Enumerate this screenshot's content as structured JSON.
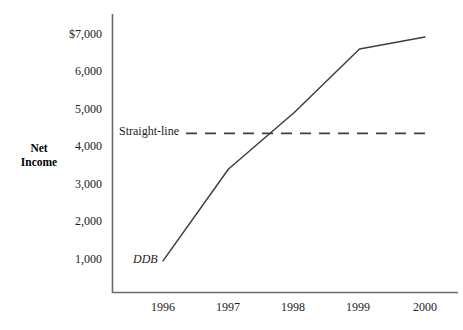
{
  "chart_data": {
    "type": "line",
    "title": "",
    "xlabel": "",
    "ylabel": "Net Income",
    "ylabel_lines": [
      "Net",
      "Income"
    ],
    "x": [
      1996,
      1997,
      1998,
      1999,
      2000
    ],
    "categories": [
      "1996",
      "1997",
      "1998",
      "1999",
      "2000"
    ],
    "xtick_labels": [
      "1996",
      "1997",
      "1998",
      "1999",
      "2000"
    ],
    "ytick_labels": [
      "$7,000",
      "6,000",
      "5,000",
      "4,000",
      "3,000",
      "2,000",
      "1,000"
    ],
    "ytick_values": [
      7000,
      6000,
      5000,
      4000,
      3000,
      2000,
      1000
    ],
    "ylim": [
      0,
      7400
    ],
    "xlim": [
      1995.75,
      2000.25
    ],
    "grid": false,
    "legend_position": "inline-annotation",
    "series": [
      {
        "name": "DDB",
        "label": "DDB",
        "style": "solid",
        "color": "#3a3a3a",
        "values": [
          950,
          3400,
          4900,
          6600,
          6920
        ]
      },
      {
        "name": "Straight-line",
        "label": "Straight-line",
        "style": "dashed",
        "color": "#3a3a3a",
        "values": [
          4350,
          4350,
          4350,
          4350,
          4350
        ]
      }
    ],
    "annotations": [
      {
        "text": "DDB",
        "x": 1996.0,
        "y": 1000,
        "style": "italic"
      },
      {
        "text": "Straight-line",
        "x": 1996.1,
        "y": 4350,
        "style": "roman"
      }
    ]
  },
  "axes": {
    "y_axis_line_color": "#6b6b6b",
    "x_axis_line_color": "#6b6b6b"
  }
}
